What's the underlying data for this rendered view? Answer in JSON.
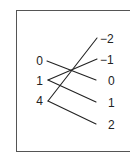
{
  "diagram": {
    "type": "mapping",
    "domain": [
      "0",
      "1",
      "4"
    ],
    "range": [
      "−2",
      "−1",
      "0",
      "1",
      "2"
    ],
    "arrows": [
      {
        "from": "0",
        "to": "0"
      },
      {
        "from": "1",
        "to": "−1"
      },
      {
        "from": "1",
        "to": "1"
      },
      {
        "from": "4",
        "to": "−2"
      },
      {
        "from": "4",
        "to": "2"
      }
    ],
    "colors": {
      "line": "#222222",
      "frame": "#555555"
    }
  }
}
